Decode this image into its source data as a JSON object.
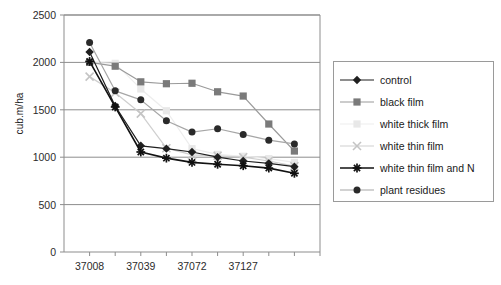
{
  "chart_data": {
    "type": "line",
    "title": "",
    "subtitle": "",
    "xlabel": "",
    "ylabel": "cub.m/ha",
    "ylim": [
      0,
      2500
    ],
    "ytick_step": 500,
    "yticks": [
      "0",
      "500",
      "1000",
      "1500",
      "2000",
      "2500"
    ],
    "grid": "horizontal",
    "legend_position": "right",
    "x": [
      1,
      2,
      3,
      4,
      5,
      6,
      7,
      8,
      9
    ],
    "categories": [
      "37008",
      "",
      "37039",
      "",
      "37072",
      "",
      "37127",
      "",
      ""
    ],
    "xticks_labeled": [
      "37008",
      "37039",
      "37072",
      "37127"
    ],
    "xtick_label_positions": [
      1,
      3,
      5,
      7
    ],
    "series": [
      {
        "name": "control",
        "marker": "diamond",
        "color": "#1f1f1f",
        "line_color": "#1f1f1f",
        "values": [
          2110,
          1540,
          1120,
          1090,
          1055,
          1000,
          960,
          935,
          900
        ]
      },
      {
        "name": "black film",
        "marker": "square",
        "color": "#7a7a7a",
        "line_color": "#9a9a9a",
        "values": [
          2000,
          1960,
          1795,
          1775,
          1780,
          1690,
          1645,
          1350,
          1065
        ]
      },
      {
        "name": "white thick film",
        "marker": "square-light",
        "color": "#e8e8e8",
        "line_color": "#ededed",
        "values": [
          2000,
          1990,
          1720,
          1490,
          1090,
          1030,
          1010,
          985,
          945
        ]
      },
      {
        "name": "white thin film",
        "marker": "x",
        "color": "#c4c4c4",
        "line_color": "#cfcfcf",
        "values": [
          1850,
          1680,
          1460,
          1095,
          1025,
          1015,
          1000,
          960,
          905
        ]
      },
      {
        "name": "white thin film and N",
        "marker": "asterisk",
        "color": "#111111",
        "line_color": "#111111",
        "values": [
          2010,
          1530,
          1055,
          990,
          945,
          925,
          910,
          885,
          830
        ]
      },
      {
        "name": "plant residues",
        "marker": "circle",
        "color": "#2a2a2a",
        "line_color": "#a6a6a6",
        "values": [
          2210,
          1700,
          1605,
          1385,
          1265,
          1300,
          1240,
          1180,
          1140
        ]
      }
    ]
  },
  "legend": {
    "items": [
      {
        "label": "control",
        "marker": "diamond"
      },
      {
        "label": "black film",
        "marker": "square"
      },
      {
        "label": "white thick film",
        "marker": "square-light"
      },
      {
        "label": "white thin film",
        "marker": "x"
      },
      {
        "label": "white thin film and N",
        "marker": "asterisk"
      },
      {
        "label": "plant residues",
        "marker": "circle"
      }
    ]
  },
  "colors": {
    "plot_border": "#8d8d8d",
    "gridline": "#8d8d8d",
    "axis": "#8d8d8d",
    "background": "#ffffff",
    "text": "#1a1a1a"
  }
}
